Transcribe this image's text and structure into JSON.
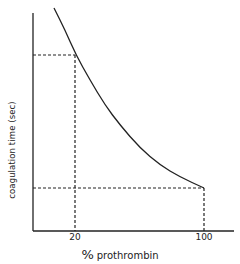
{
  "chart_data": {
    "type": "line",
    "title": "",
    "xlabel": "% prothrombin",
    "ylabel": "coagulation time (sec)",
    "x_ticks": [
      "20",
      "100"
    ],
    "y_ticks": [],
    "grid": false,
    "legend": null,
    "series": [
      {
        "name": "coagulation time vs prothrombin",
        "style": "solid curve, decreasing",
        "x": [
          7,
          14,
          20,
          29,
          38,
          48,
          60,
          73,
          85,
          100
        ],
        "y_relative": [
          1.0,
          0.9,
          0.79,
          0.68,
          0.57,
          0.48,
          0.38,
          0.31,
          0.25,
          0.2
        ]
      }
    ],
    "annotations": [
      {
        "type": "dashed-guide",
        "x": 20,
        "description": "vertical and horizontal dashed lines from curve at 20% to axes"
      },
      {
        "type": "dashed-guide",
        "x": 100,
        "description": "vertical and horizontal dashed lines from curve at 100% to axes"
      }
    ],
    "pixel_geometry": {
      "axis_origin": [
        33,
        231
      ],
      "y_axis_top": 13,
      "x_axis_right": 234,
      "curve_points": [
        [
          54,
          8
        ],
        [
          65,
          30
        ],
        [
          76,
          55
        ],
        [
          90,
          80
        ],
        [
          105,
          105
        ],
        [
          120,
          125
        ],
        [
          140,
          148
        ],
        [
          160,
          165
        ],
        [
          180,
          177
        ],
        [
          204,
          188
        ]
      ],
      "guide_20": {
        "x": 75,
        "y": 55
      },
      "guide_100": {
        "x": 204,
        "y": 188
      }
    }
  },
  "labels": {
    "y_axis": "coagulation   time (sec)",
    "x_tick_20": "20",
    "x_tick_100": "100",
    "x_axis_pct": "%",
    "x_axis_word": "prothrombin"
  }
}
